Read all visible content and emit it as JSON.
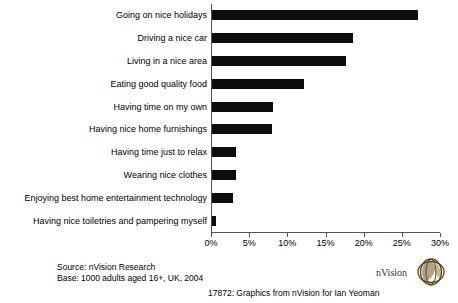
{
  "chart_data": {
    "type": "bar",
    "orientation": "horizontal",
    "title": "",
    "xlabel": "",
    "ylabel": "",
    "xlim": [
      0,
      30
    ],
    "grid": false,
    "legend": null,
    "categories": [
      "Going on nice holidays",
      "Driving a nice car",
      "Living in a nice area",
      "Eating good quality food",
      "Having time on my own",
      "Having nice home furnishings",
      "Having time just to relax",
      "Wearing nice clothes",
      "Enjoying best home entertainment technology",
      "Having nice toiletries and pampering myself"
    ],
    "values": [
      27,
      18.5,
      17.5,
      12,
      8,
      7.8,
      3.2,
      3.2,
      2.7,
      0.5
    ],
    "tick_labels": [
      "0%",
      "5%",
      "10%",
      "15%",
      "20%",
      "25%",
      "30%"
    ],
    "tick_values": [
      0,
      5,
      10,
      15,
      20,
      25,
      30
    ],
    "bar_color": "#0d0d0d",
    "axis_color": "#555555"
  },
  "footer": {
    "source": "Source: nVision Research",
    "base": "Base: 1000 adults aged 16+, UK, 2004",
    "credit": "17872: Graphics from  nVision  for Ian Yeoman"
  },
  "logo": {
    "text": "nVision"
  }
}
